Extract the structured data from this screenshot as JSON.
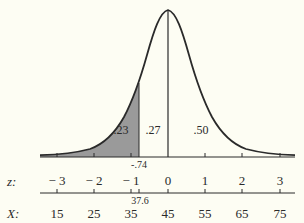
{
  "diagram": {
    "type": "normal-distribution-curve",
    "shaded_region": {
      "from_z": "-inf",
      "to_z": -0.74,
      "fill_color": "#9a9a9a"
    },
    "area_labels": [
      {
        "text": ".23",
        "region": "left-tail-shaded"
      },
      {
        "text": ".27",
        "region": "between-boundary-and-mean"
      },
      {
        "text": ".50",
        "region": "right-half"
      }
    ],
    "boundary": {
      "z_label": "-.74",
      "x_label": "37.6"
    },
    "z_axis": {
      "name": "z:",
      "ticks": [
        "− 3",
        "− 2",
        "− 1",
        "0",
        "1",
        "2",
        "3"
      ]
    },
    "x_axis": {
      "name": "X:",
      "ticks": [
        "15",
        "25",
        "35",
        "45",
        "55",
        "65",
        "75"
      ]
    },
    "colors": {
      "background": "#fdfdf3",
      "curve": "#2a2a2a",
      "shade": "#9a9a9a"
    }
  }
}
